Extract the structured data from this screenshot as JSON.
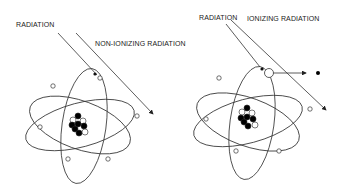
{
  "left_panel": {
    "radiation_label": "RADIATION",
    "outcome_label": "NON-IONIZING RADIATION"
  },
  "right_panel": {
    "radiation_label": "RADIATION",
    "outcome_label": "IONIZING RADIATION"
  },
  "colors": {
    "line": "#222222",
    "proton": "#000000",
    "neutron": "#ffffff",
    "background": "#ffffff"
  }
}
